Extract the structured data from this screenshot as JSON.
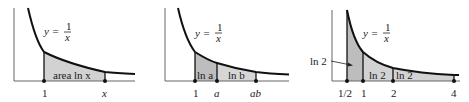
{
  "figure": {
    "colors": {
      "curve": "#111111",
      "axis": "#555555",
      "fill": "#cfcfcf",
      "fill_dark": "#b8b8b8",
      "text": "#1a1a1a"
    },
    "panels": [
      {
        "equation": {
          "lhs": "y =",
          "num": "1",
          "den": "x"
        },
        "region_label": "area ln x",
        "ticks": [
          "1",
          "x"
        ]
      },
      {
        "equation": {
          "lhs": "y =",
          "num": "1",
          "den": "x"
        },
        "region_labels": [
          "ln a",
          "ln b"
        ],
        "ticks": [
          "1",
          "a",
          "ab"
        ]
      },
      {
        "equation": {
          "lhs": "y =",
          "num": "1",
          "den": "x"
        },
        "callout": "ln 2",
        "region_labels": [
          "ln 2",
          "ln 2"
        ],
        "ticks": [
          "1/2",
          "1",
          "2",
          "4"
        ]
      }
    ]
  }
}
